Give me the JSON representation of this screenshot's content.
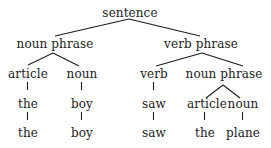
{
  "diagram": {
    "type": "parse-tree",
    "nodes": {
      "root": {
        "label": "sentence"
      },
      "np": {
        "label": "noun phrase"
      },
      "vp": {
        "label": "verb phrase"
      },
      "np_article": {
        "label": "article"
      },
      "np_noun": {
        "label": "noun"
      },
      "vp_verb": {
        "label": "verb"
      },
      "vp_np": {
        "label": "noun phrase"
      },
      "np_article_word": {
        "label": "the"
      },
      "np_noun_word": {
        "label": "boy"
      },
      "vp_verb_word": {
        "label": "saw"
      },
      "vp_np_article": {
        "label": "article"
      },
      "vp_np_noun": {
        "label": "noun"
      },
      "leaf_the_1": {
        "label": "the"
      },
      "leaf_boy": {
        "label": "boy"
      },
      "leaf_saw": {
        "label": "saw"
      },
      "leaf_the_2": {
        "label": "the"
      },
      "leaf_plane": {
        "label": "plane"
      }
    },
    "edges": [
      [
        "root",
        "np"
      ],
      [
        "root",
        "vp"
      ],
      [
        "np",
        "np_article"
      ],
      [
        "np",
        "np_noun"
      ],
      [
        "vp",
        "vp_verb"
      ],
      [
        "vp",
        "vp_np"
      ],
      [
        "np_article",
        "np_article_word"
      ],
      [
        "np_noun",
        "np_noun_word"
      ],
      [
        "vp_verb",
        "vp_verb_word"
      ],
      [
        "vp_np",
        "vp_np_article"
      ],
      [
        "vp_np",
        "vp_np_noun"
      ],
      [
        "np_article_word",
        "leaf_the_1"
      ],
      [
        "np_noun_word",
        "leaf_boy"
      ],
      [
        "vp_verb_word",
        "leaf_saw"
      ],
      [
        "vp_np_article",
        "leaf_the_2"
      ],
      [
        "vp_np_noun",
        "leaf_plane"
      ]
    ],
    "colors": {
      "ink": "#1c1c1c",
      "background": "#ffffff"
    }
  }
}
